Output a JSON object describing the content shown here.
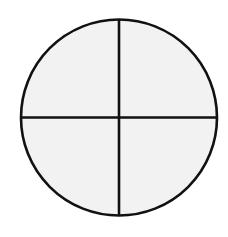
{
  "diagram": {
    "type": "circle-divided-into-quarters",
    "parts": 4,
    "colors": {
      "background": "#ffffff",
      "fill": "#f2f2f2",
      "stroke": "#111111"
    },
    "geometry": {
      "cx": 119,
      "cy": 117.5,
      "r": 98,
      "stroke_width": 2.6
    },
    "sections": [
      {
        "name": "top-left",
        "shaded": false
      },
      {
        "name": "top-right",
        "shaded": false
      },
      {
        "name": "bottom-left",
        "shaded": false
      },
      {
        "name": "bottom-right",
        "shaded": false
      }
    ]
  }
}
